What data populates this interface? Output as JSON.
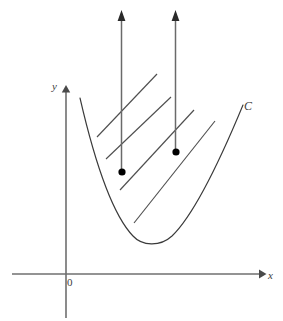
{
  "figure": {
    "name": "parabola-with-upward-vector-field",
    "width": 283,
    "height": 321,
    "background_color": "#ffffff"
  },
  "axes": {
    "x_axis": {
      "label": "x",
      "color": "#6f6f6f",
      "y_position": 274,
      "start_x": 12,
      "end_x": 265,
      "arrow": "right"
    },
    "y_axis": {
      "label": "y",
      "color": "#6f6f6f",
      "x_position": 66,
      "start_y": 318,
      "end_y": 86,
      "arrow": "up"
    },
    "origin_label": "0"
  },
  "curve": {
    "label": "C",
    "color": "#3a3a3a",
    "type": "parabola",
    "vertex": [
      150,
      242
    ],
    "left_end": [
      80,
      98
    ],
    "right_end": [
      243,
      105
    ],
    "path": "M 80 98 C 92 150, 110 212, 133 236 C 142 246, 160 247, 172 236 C 196 213, 226 146, 243 105"
  },
  "hatch_lines": {
    "color": "#4f4f4f",
    "count": 4,
    "slope_description": "parallel, rising to the right",
    "segments": [
      {
        "x1": 97,
        "y1": 137,
        "x2": 157,
        "y2": 74
      },
      {
        "x1": 106,
        "y1": 159,
        "x2": 171,
        "y2": 97
      },
      {
        "x1": 120,
        "y1": 190,
        "x2": 194,
        "y2": 110
      },
      {
        "x1": 134,
        "y1": 223,
        "x2": 215,
        "y2": 121
      }
    ]
  },
  "vectors": {
    "color": "#6a6a6a",
    "dot_color": "#000000",
    "arrows": [
      {
        "name": "left-vector",
        "base_x": 122,
        "base_y": 172,
        "tip_x": 121,
        "tip_y": 10
      },
      {
        "name": "right-vector",
        "base_x": 176,
        "base_y": 152,
        "tip_x": 175,
        "tip_y": 10
      }
    ]
  },
  "chart_data": {
    "type": "line",
    "title": "",
    "xlabel": "x",
    "ylabel": "y",
    "annotations": [
      "C",
      "0",
      "y",
      "x"
    ],
    "series": [
      {
        "name": "C",
        "description": "upward-opening parabola labeled C",
        "points": [
          [
            80,
            98
          ],
          [
            90,
            142
          ],
          [
            101,
            180
          ],
          [
            112,
            208
          ],
          [
            124,
            228
          ],
          [
            136,
            239
          ],
          [
            150,
            242
          ],
          [
            164,
            238
          ],
          [
            178,
            228
          ],
          [
            194,
            205
          ],
          [
            212,
            170
          ],
          [
            228,
            137
          ],
          [
            243,
            105
          ]
        ]
      }
    ],
    "vector_field": {
      "description": "two vertical upward arrows originating from marked points inside the region bounded by C",
      "points": [
        [
          122,
          172
        ],
        [
          176,
          152
        ]
      ],
      "direction": "up"
    },
    "grid": false,
    "legend": "none"
  }
}
